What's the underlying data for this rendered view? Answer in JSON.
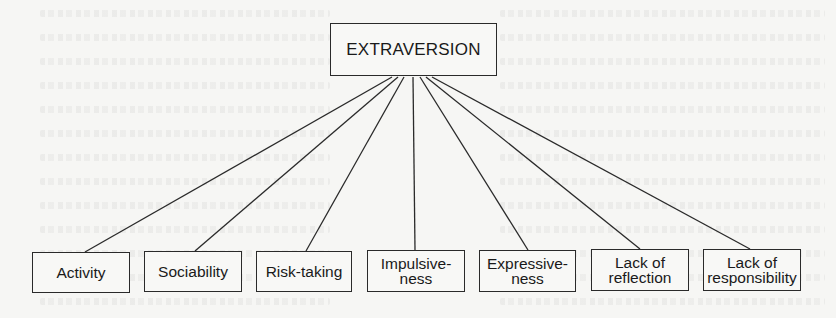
{
  "diagram": {
    "root": {
      "label": "EXTRAVERSION",
      "box": {
        "x": 330,
        "y": 23,
        "w": 167,
        "h": 53
      }
    },
    "children": [
      {
        "label": "Activity",
        "box": {
          "x": 32,
          "y": 252,
          "w": 98,
          "h": 41
        }
      },
      {
        "label": "Sociability",
        "box": {
          "x": 144,
          "y": 251,
          "w": 98,
          "h": 41
        }
      },
      {
        "label": "Risk-taking",
        "box": {
          "x": 256,
          "y": 251,
          "w": 96,
          "h": 41
        }
      },
      {
        "label": "Impulsive-\nness",
        "box": {
          "x": 367,
          "y": 250,
          "w": 98,
          "h": 42
        }
      },
      {
        "label": "Expressive-\nness",
        "box": {
          "x": 479,
          "y": 250,
          "w": 97,
          "h": 42
        }
      },
      {
        "label": "Lack of\nreflection",
        "box": {
          "x": 591,
          "y": 249,
          "w": 98,
          "h": 42
        }
      },
      {
        "label": "Lack of\nresponsibility",
        "box": {
          "x": 703,
          "y": 249,
          "w": 98,
          "h": 42
        }
      }
    ],
    "edges": [
      {
        "from": [
          392,
          77
        ],
        "to": [
          85,
          252
        ]
      },
      {
        "from": [
          398,
          77
        ],
        "to": [
          195,
          251
        ]
      },
      {
        "from": [
          404,
          77
        ],
        "to": [
          306,
          251
        ]
      },
      {
        "from": [
          413,
          77
        ],
        "to": [
          415,
          250
        ]
      },
      {
        "from": [
          420,
          77
        ],
        "to": [
          528,
          250
        ]
      },
      {
        "from": [
          426,
          77
        ],
        "to": [
          640,
          249
        ]
      },
      {
        "from": [
          432,
          77
        ],
        "to": [
          750,
          249
        ]
      }
    ],
    "colors": {
      "stroke": "#2a2a2a",
      "background": "#f6f6f4",
      "text": "#1a1a1a"
    }
  }
}
